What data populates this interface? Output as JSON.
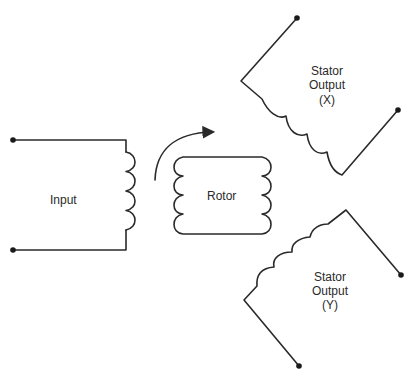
{
  "diagram": {
    "type": "resolver-schematic",
    "colors": {
      "stroke": "#2a2a2a",
      "background": "#ffffff"
    },
    "input": {
      "label": "Input"
    },
    "rotor": {
      "label": "Rotor",
      "rotation_arrow": "clockwise-arrow"
    },
    "stator_x": {
      "line1": "Stator",
      "line2": "Output",
      "line3": "(X)"
    },
    "stator_y": {
      "line1": "Stator",
      "line2": "Output",
      "line3": "(Y)"
    }
  }
}
